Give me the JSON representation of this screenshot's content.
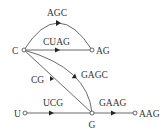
{
  "diagram": {
    "type": "directed-graph",
    "nodes": [
      {
        "id": "C",
        "label": "C"
      },
      {
        "id": "AG",
        "label": "AG"
      },
      {
        "id": "U",
        "label": "U"
      },
      {
        "id": "G",
        "label": "G"
      },
      {
        "id": "AAG",
        "label": "AAG"
      }
    ],
    "edges": [
      {
        "from": "C",
        "to": "AG",
        "label": "AGC"
      },
      {
        "from": "C",
        "to": "AG",
        "label": "CUAG"
      },
      {
        "from": "C",
        "to": "G",
        "label": "CG"
      },
      {
        "from": "C",
        "to": "G",
        "label": "GAGC"
      },
      {
        "from": "U",
        "to": "G",
        "label": "UCG"
      },
      {
        "from": "G",
        "to": "AAG",
        "label": "GAAG"
      }
    ]
  }
}
